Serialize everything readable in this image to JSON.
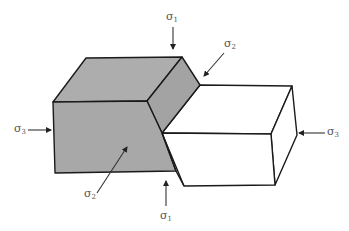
{
  "diagram": {
    "colors": {
      "shaded_block": "#a8a8a8",
      "shaded_top": "#b0b0b0",
      "shaded_side": "#9e9e9e",
      "unshaded_block": "#ffffff",
      "edges": "#1a1a1a",
      "arrows": "#333333",
      "labels": "#555555"
    },
    "labels": {
      "sigma1_top": {
        "symbol": "σ",
        "sub": "1"
      },
      "sigma2_top_right": {
        "symbol": "σ",
        "sub": "2"
      },
      "sigma3_left": {
        "symbol": "σ",
        "sub": "3"
      },
      "sigma3_right": {
        "symbol": "σ",
        "sub": "3"
      },
      "sigma2_bottom_left": {
        "symbol": "σ",
        "sub": "2"
      },
      "sigma1_bottom": {
        "symbol": "σ",
        "sub": "1"
      }
    }
  }
}
